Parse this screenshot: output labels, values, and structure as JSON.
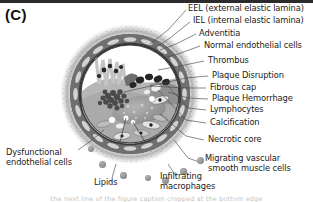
{
  "figure": {
    "panel_letter": "(C)",
    "caption_bleed": "the next line of the figure caption cropped at the bottom edge",
    "colors": {
      "background": "#ffffff",
      "label_text": "#1a1a1a",
      "leader_line": "#4a4a4a",
      "adventitia_speckle": "#9a9a9a",
      "media_band": "#6f6f6f",
      "smooth_muscle_cell": "#cfcfcf",
      "iel_dark": "#3c3c3c",
      "lumen": "#ffffff",
      "necrotic_core": "#9d9d9d",
      "fibrous_cap": "#b4b4b4",
      "thrombus": "#4f4f4f",
      "lymphocyte": "#2a2a2a",
      "calcification": "#e8e8e8",
      "macrophage_dot": "#8a8a8a"
    }
  },
  "labels": {
    "eel": "EEL (external elastic lamina)",
    "iel": "IEL (internal elastic lamina)",
    "adventitia": "Adventitia",
    "normal_endothelial_cells": "Normal endothelial cells",
    "thrombus": "Thrombus",
    "plaque_disruption": "Plaque Disruption",
    "fibrous_cap": "Fibrous cap",
    "plaque_hemorrhage": "Plaque Hemorrhage",
    "lymphocytes": "Lymphocytes",
    "calcification": "Calcification",
    "necrotic_core": "Necrotic core",
    "migrating_vsmc_line1": "Migrating vascular",
    "migrating_vsmc_line2": "smooth muscle cells",
    "dysfunctional_line1": "Dysfunctional",
    "dysfunctional_line2": "endothelial cells",
    "lipids": "Lipids",
    "infiltrating_line1": "Infiltrating",
    "infiltrating_line2": "macrophages"
  }
}
